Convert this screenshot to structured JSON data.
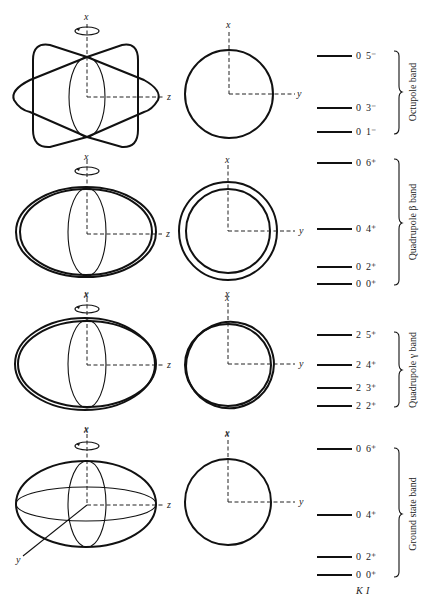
{
  "axes": {
    "x": "x",
    "y": "y",
    "z": "z"
  },
  "column_labels": {
    "K": "K",
    "I": "I"
  },
  "panels": [
    {
      "id": "octupole",
      "band_label": "Octupole band",
      "levels": [
        {
          "K": "0",
          "I": "5⁻"
        },
        {
          "K": "0",
          "I": "3⁻"
        },
        {
          "K": "0",
          "I": "1⁻"
        }
      ]
    },
    {
      "id": "quadrupole-beta",
      "band_label": "Quadrupole β band",
      "levels": [
        {
          "K": "0",
          "I": "6⁺"
        },
        {
          "K": "0",
          "I": "4⁺"
        },
        {
          "K": "0",
          "I": "2⁺"
        },
        {
          "K": "0",
          "I": "0⁺"
        }
      ]
    },
    {
      "id": "quadrupole-gamma",
      "band_label": "Quadrupole γ band",
      "levels": [
        {
          "K": "2",
          "I": "5⁺"
        },
        {
          "K": "2",
          "I": "4⁺"
        },
        {
          "K": "2",
          "I": "3⁺"
        },
        {
          "K": "2",
          "I": "2⁺"
        }
      ]
    },
    {
      "id": "ground-state",
      "band_label": "Ground state band",
      "levels": [
        {
          "K": "0",
          "I": "6⁺"
        },
        {
          "K": "0",
          "I": "4⁺"
        },
        {
          "K": "0",
          "I": "2⁺"
        },
        {
          "K": "0",
          "I": "0⁺"
        }
      ]
    }
  ]
}
